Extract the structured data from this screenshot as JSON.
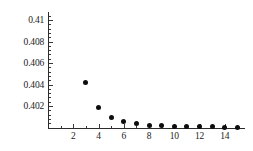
{
  "chart_data": {
    "type": "scatter",
    "title": "",
    "subtitle": "",
    "xlabel": "",
    "ylabel": "",
    "x": [
      3,
      4,
      5,
      6,
      7,
      8,
      9,
      10,
      11,
      12,
      13,
      14,
      15
    ],
    "values": [
      0.4042,
      0.40185,
      0.40092,
      0.40058,
      0.40035,
      0.40022,
      0.40015,
      0.40011,
      0.40008,
      0.40006,
      0.40005,
      0.40004,
      0.40003
    ],
    "series": [
      {
        "name": "series-1",
        "values": [
          0.4042,
          0.40185,
          0.40092,
          0.40058,
          0.40035,
          0.40022,
          0.40015,
          0.40011,
          0.40008,
          0.40006,
          0.40005,
          0.40004,
          0.40003
        ]
      }
    ],
    "xlim": [
      0,
      15.6
    ],
    "ylim": [
      0.39995,
      0.41075
    ],
    "grid": false,
    "legend": false,
    "legend_position": "none",
    "marker": "filled-circle",
    "marker_color": "#0d0d0d",
    "axis_color": "#2b2b2b",
    "background_color": "#ffffff",
    "y_ticks": [
      {
        "value": 0.402,
        "label": "0.402"
      },
      {
        "value": 0.404,
        "label": "0.404"
      },
      {
        "value": 0.406,
        "label": "0.406"
      },
      {
        "value": 0.408,
        "label": "0.408"
      },
      {
        "value": 0.41,
        "label": "0.41"
      }
    ],
    "y_minor_tick_count_between": 4,
    "x_ticks": [
      {
        "value": 2,
        "label": "2"
      },
      {
        "value": 4,
        "label": "4"
      },
      {
        "value": 6,
        "label": "6"
      },
      {
        "value": 8,
        "label": "8"
      },
      {
        "value": 10,
        "label": "10"
      },
      {
        "value": 12,
        "label": "12"
      },
      {
        "value": 14,
        "label": "14"
      }
    ],
    "x_minor_ticks": [
      1,
      3,
      5,
      7,
      9,
      11,
      13,
      15
    ]
  }
}
